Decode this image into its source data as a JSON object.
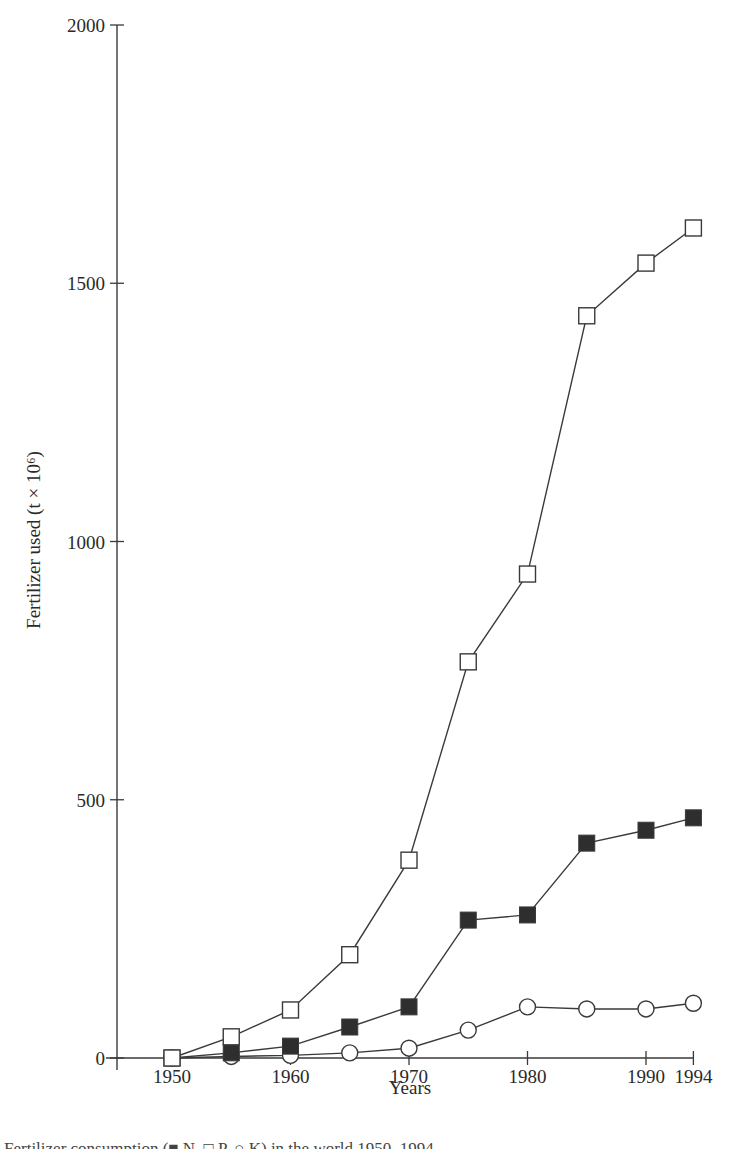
{
  "chart_data": {
    "type": "line",
    "title": "",
    "xlabel": "Years",
    "ylabel": "Fertilizer used (t × 10⁶)",
    "xlim": [
      1945,
      1994
    ],
    "ylim": [
      0,
      2000
    ],
    "x_ticks": [
      1950,
      1960,
      1970,
      1980,
      1990,
      1994
    ],
    "y_ticks": [
      0,
      500,
      1000,
      1500,
      2000
    ],
    "grid": false,
    "legend": "none (series identified by marker in caption)",
    "x": [
      1950,
      1955,
      1960,
      1965,
      1970,
      1975,
      1980,
      1985,
      1990,
      1994
    ],
    "series": [
      {
        "name": "open-square",
        "marker": "open-square",
        "values": [
          0,
          41,
          93,
          200,
          383,
          767,
          937,
          1437,
          1539,
          1607
        ]
      },
      {
        "name": "filled-square",
        "marker": "filled-square",
        "values": [
          0,
          10,
          23,
          60,
          99,
          267,
          277,
          416,
          441,
          465
        ]
      },
      {
        "name": "open-circle",
        "marker": "open-circle",
        "values": [
          0,
          3,
          5,
          10,
          19,
          54,
          99,
          95,
          95,
          106
        ]
      }
    ]
  },
  "labels": {
    "xlabel": "Years",
    "ylabel": "Fertilizer used (t × 10⁶)",
    "caption": "Fertilizer consumption (■ N, □ P, ○ K) in the world 1950–1994"
  },
  "colors": {
    "line": "#3a3a3a",
    "filled_marker": "#2e2e2e",
    "open_marker_fill": "#ffffff",
    "axis": "#3a3a3a"
  }
}
